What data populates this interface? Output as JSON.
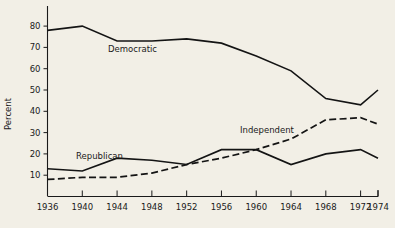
{
  "chart_data": {
    "type": "line",
    "title": "",
    "xlabel": "",
    "ylabel": "Percent",
    "x": [
      1936,
      1940,
      1944,
      1948,
      1952,
      1956,
      1960,
      1964,
      1968,
      1972,
      1974
    ],
    "xlim": [
      1936,
      1974
    ],
    "ylim": [
      0,
      85
    ],
    "yticks": [
      10,
      20,
      30,
      40,
      50,
      60,
      70,
      80
    ],
    "xticks": [
      1936,
      1940,
      1944,
      1948,
      1952,
      1956,
      1960,
      1964,
      1968,
      1972,
      1974
    ],
    "grid": false,
    "legend_position": "inline-annotations",
    "series": [
      {
        "name": "Democratic",
        "style": "solid",
        "label_text": "Democratic",
        "values": [
          78,
          80,
          73,
          73,
          74,
          72,
          66,
          59,
          46,
          43,
          50
        ]
      },
      {
        "name": "Republican",
        "style": "solid",
        "label_text": "Republican",
        "values": [
          13,
          12,
          18,
          17,
          15,
          22,
          22,
          15,
          20,
          22,
          18
        ]
      },
      {
        "name": "Independent",
        "style": "dashed",
        "label_text": "Independent",
        "values": [
          8,
          9,
          9,
          11,
          15,
          18,
          22,
          27,
          36,
          37,
          34
        ]
      }
    ]
  },
  "axis": {
    "y_title": "Percent",
    "y_tick_labels": [
      "80",
      "70",
      "60",
      "50",
      "40",
      "30",
      "20",
      "10"
    ],
    "x_tick_labels": [
      "1936",
      "1940",
      "1944",
      "1948",
      "1952",
      "1956",
      "1960",
      "1964",
      "1968",
      "1972",
      "1974"
    ]
  },
  "annotations": {
    "democratic": "Democratic",
    "republican": "Republican",
    "independent": "Independent"
  },
  "colors": {
    "background": "#f2efe6",
    "ink": "#141414",
    "axis": "#1a1a1a"
  }
}
